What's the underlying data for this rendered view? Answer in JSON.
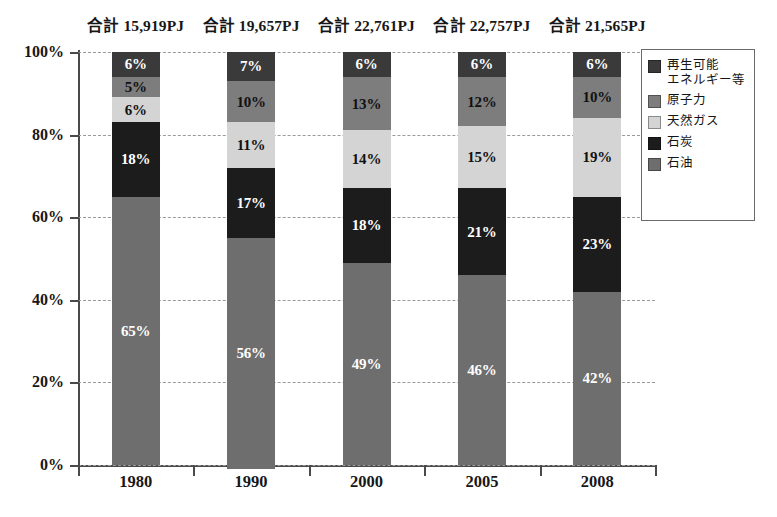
{
  "chart_data": {
    "type": "bar",
    "subtype": "100% stacked column",
    "title": "",
    "xlabel": "",
    "ylabel": "",
    "categories": [
      "1980",
      "1990",
      "2000",
      "2005",
      "2008"
    ],
    "ylim": [
      0,
      100
    ],
    "ytick_labels": [
      "0%",
      "20%",
      "40%",
      "60%",
      "80%",
      "100%"
    ],
    "ytick_values": [
      0,
      20,
      40,
      60,
      80,
      100
    ],
    "grid": true,
    "grid_style": "dashed",
    "legend_position": "right",
    "value_suffix": "%",
    "series": [
      {
        "name": "石油",
        "color": "#6e6e6e",
        "label_color": "#ffffff",
        "values": [
          65,
          56,
          49,
          46,
          42
        ],
        "labels": [
          "65%",
          "56%",
          "49%",
          "46%",
          "42%"
        ]
      },
      {
        "name": "石炭",
        "color": "#1c1c1c",
        "label_color": "#ffffff",
        "values": [
          18,
          17,
          18,
          21,
          23
        ],
        "labels": [
          "18%",
          "17%",
          "18%",
          "21%",
          "23%"
        ]
      },
      {
        "name": "天然ガス",
        "color": "#d4d4d4",
        "label_color": "#111111",
        "values": [
          6,
          11,
          14,
          15,
          19
        ],
        "labels": [
          "6%",
          "11%",
          "14%",
          "15%",
          "19%"
        ]
      },
      {
        "name": "原子力",
        "color": "#7d7d7d",
        "label_color": "#111111",
        "values": [
          5,
          10,
          13,
          12,
          10
        ],
        "labels": [
          "5%",
          "10%",
          "13%",
          "12%",
          "10%"
        ]
      },
      {
        "name": "再生可能エネルギー等",
        "color": "#3a3a3a",
        "label_color": "#ffffff",
        "values": [
          6,
          7,
          6,
          6,
          6
        ],
        "labels": [
          "6%",
          "7%",
          "6%",
          "6%",
          "6%"
        ]
      }
    ],
    "annotations": {
      "totals": [
        "合計 15,919PJ",
        "合計 19,657PJ",
        "合計 22,761PJ",
        "合計 22,757PJ",
        "合計 21,565PJ"
      ]
    }
  },
  "legend": {
    "items": [
      {
        "label": "再生可能\nエネルギー等",
        "color": "#3a3a3a"
      },
      {
        "label": "原子力",
        "color": "#7d7d7d"
      },
      {
        "label": "天然ガス",
        "color": "#d4d4d4"
      },
      {
        "label": "石炭",
        "color": "#1c1c1c"
      },
      {
        "label": "石油",
        "color": "#6e6e6e"
      }
    ]
  },
  "axes": {
    "y_tick_labels": [
      "100%",
      "80%",
      "60%",
      "40%",
      "20%",
      "0%"
    ],
    "x_tick_labels": [
      "1980",
      "1990",
      "2000",
      "2005",
      "2008"
    ]
  }
}
